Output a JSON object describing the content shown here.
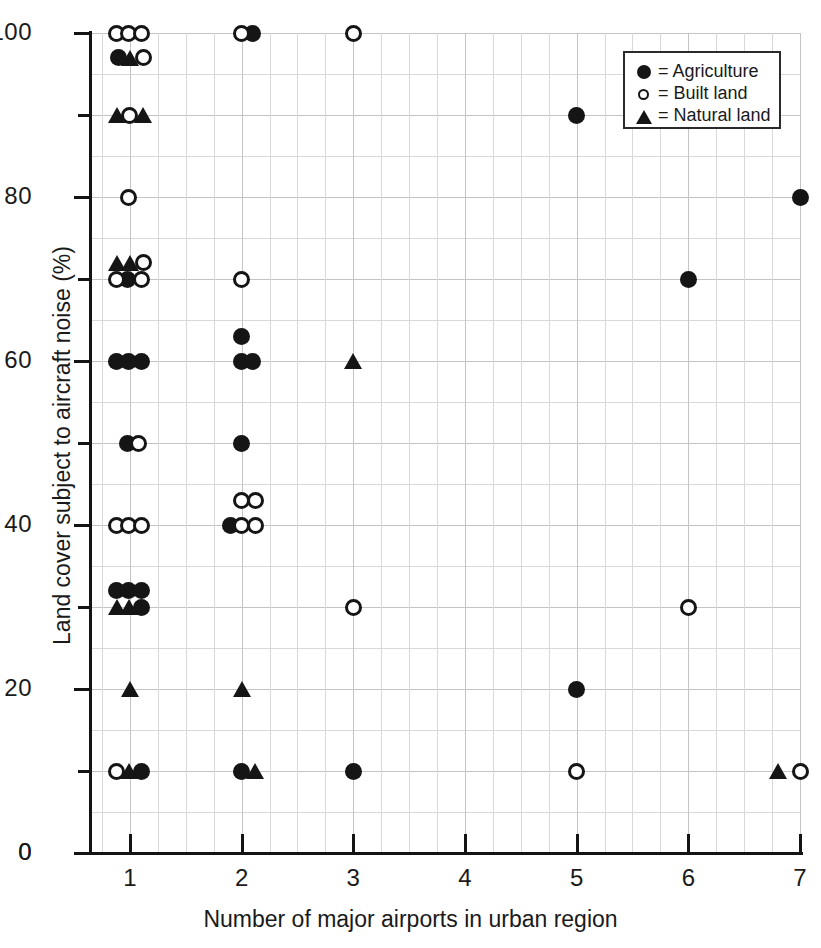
{
  "chart_data": {
    "type": "scatter",
    "title": "",
    "xlabel": "Number of major airports in urban region",
    "ylabel": "Land cover subject to aircraft noise (%)",
    "xlim": [
      0.66,
      7.0
    ],
    "ylim": [
      0,
      100
    ],
    "grid": true,
    "legend_position": "top-right",
    "x_ticks": [
      1,
      2,
      3,
      4,
      5,
      6,
      7
    ],
    "x_tick_labels": [
      "1",
      "2",
      "3",
      "4",
      "5",
      "6",
      "7"
    ],
    "x_origin_label": "0",
    "y_ticks_major": [
      0,
      20,
      40,
      60,
      80,
      100
    ],
    "y_tick_labels": [
      "0",
      "20",
      "40",
      "60",
      "80",
      "100"
    ],
    "y_ticks_minor": [
      10,
      30,
      50,
      70,
      90
    ],
    "series": [
      {
        "name": "Agriculture",
        "marker": "filled-circle",
        "points": [
          [
            2.1,
            100
          ],
          [
            0.9,
            97
          ],
          [
            0.98,
            70
          ],
          [
            5.0,
            90
          ],
          [
            7.0,
            80
          ],
          [
            6.0,
            70
          ],
          [
            2.0,
            63
          ],
          [
            0.88,
            60
          ],
          [
            0.99,
            60
          ],
          [
            1.1,
            60
          ],
          [
            2.0,
            60
          ],
          [
            2.1,
            60
          ],
          [
            0.98,
            50
          ],
          [
            2.0,
            50
          ],
          [
            1.9,
            40
          ],
          [
            0.88,
            32
          ],
          [
            0.99,
            32
          ],
          [
            1.1,
            32
          ],
          [
            1.1,
            30
          ],
          [
            5.0,
            20
          ],
          [
            1.1,
            10
          ],
          [
            2.0,
            10
          ],
          [
            3.0,
            10
          ]
        ]
      },
      {
        "name": "Built land",
        "marker": "open-circle",
        "points": [
          [
            0.88,
            100
          ],
          [
            0.99,
            100
          ],
          [
            1.1,
            100
          ],
          [
            2.0,
            100
          ],
          [
            3.0,
            100
          ],
          [
            1.12,
            97
          ],
          [
            1.0,
            90
          ],
          [
            0.99,
            80
          ],
          [
            1.12,
            72
          ],
          [
            0.88,
            70
          ],
          [
            1.1,
            70
          ],
          [
            2.0,
            70
          ],
          [
            1.08,
            50
          ],
          [
            2.0,
            43
          ],
          [
            2.12,
            43
          ],
          [
            0.88,
            40
          ],
          [
            0.99,
            40
          ],
          [
            1.1,
            40
          ],
          [
            2.0,
            40
          ],
          [
            2.12,
            40
          ],
          [
            3.0,
            30
          ],
          [
            6.0,
            30
          ],
          [
            0.88,
            10
          ],
          [
            5.0,
            10
          ],
          [
            7.0,
            10
          ]
        ]
      },
      {
        "name": "Natural land",
        "marker": "triangle",
        "points": [
          [
            1.0,
            97
          ],
          [
            0.88,
            90
          ],
          [
            1.12,
            90
          ],
          [
            0.88,
            72
          ],
          [
            1.0,
            72
          ],
          [
            3.0,
            60
          ],
          [
            0.88,
            30
          ],
          [
            0.99,
            30
          ],
          [
            1.0,
            20
          ],
          [
            2.0,
            20
          ],
          [
            0.99,
            10
          ],
          [
            2.12,
            10
          ],
          [
            6.8,
            10
          ]
        ]
      }
    ]
  },
  "legend": {
    "items": [
      {
        "glyph": "filled-circle",
        "label": "= Agriculture"
      },
      {
        "glyph": "open-circle",
        "label": "= Built land"
      },
      {
        "glyph": "triangle",
        "label": "= Natural land"
      }
    ]
  }
}
